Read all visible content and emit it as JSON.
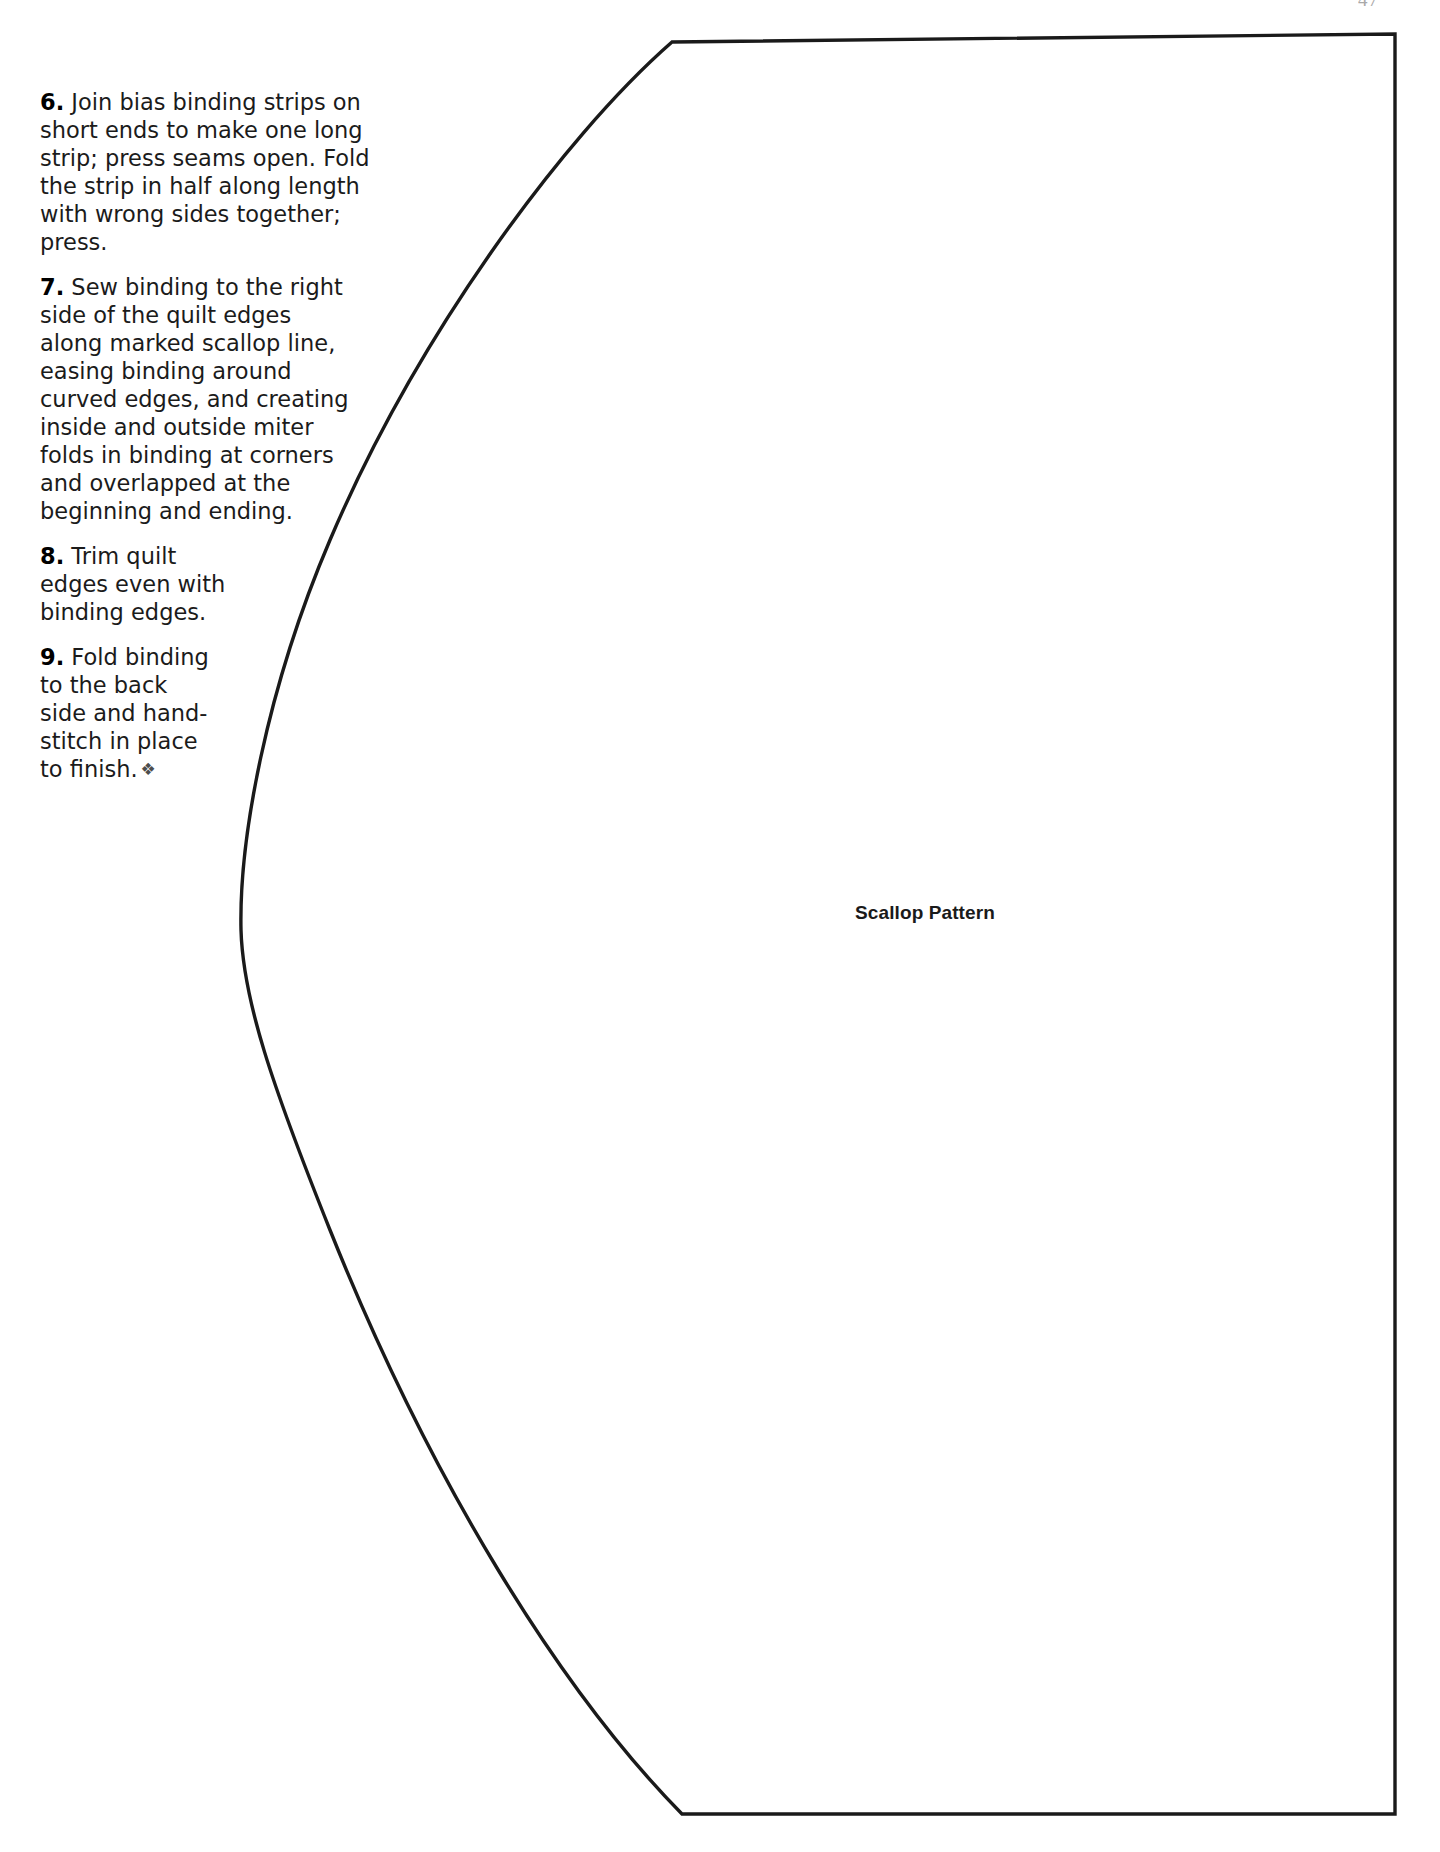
{
  "page": {
    "width": 1440,
    "height": 1852,
    "background_color": "#ffffff",
    "page_number": "47"
  },
  "instructions": {
    "steps": [
      {
        "number": "6.",
        "text": " Join bias binding strips on short ends to make one long strip; press seams open. Fold the strip in half along length with wrong sides together; press."
      },
      {
        "number": "7.",
        "text": " Sew binding to the right side of the quilt edges along marked scallop line, easing binding around curved edges, and creating inside and outside miter folds in binding at corners and overlapped at the beginning and ending."
      },
      {
        "number": "8.",
        "text": " Trim quilt edges even with binding edges."
      },
      {
        "number": "9.",
        "text": " Fold binding to the back side and hand-stitch in place to finish.",
        "ornament": "❖"
      }
    ]
  },
  "figure": {
    "label": "Scallop Pattern",
    "line_color": "#1a1a1a",
    "fill_color": "#ffffff",
    "stroke_width": 3,
    "geometry": {
      "top_corner": [
        672,
        42
      ],
      "top_right_corner": [
        1395,
        34
      ],
      "bottom_right_corner": [
        1395,
        1814
      ],
      "bottom_corner": [
        682,
        1814
      ],
      "leftmost_point": [
        241,
        930
      ],
      "description": "Quarter-scallop template: straight top, right and bottom edges forming an open rectangle, closed on the left by a large convex arc bulging toward the left margin."
    }
  }
}
